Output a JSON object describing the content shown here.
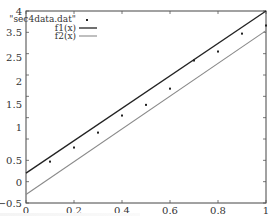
{
  "chart_data": {
    "type": "line",
    "title": "",
    "xlabel": "",
    "ylabel": "",
    "xlim": [
      0,
      1
    ],
    "ylim": [
      -0.5,
      4
    ],
    "grid": false,
    "legend_position": "top-left (inside)",
    "x_ticks": [
      "0",
      "0.2",
      "0.4",
      "0.6",
      "0.8",
      "1"
    ],
    "y_ticks_visible_labels": [
      "4",
      "3.5",
      "2.5",
      "2",
      "1.5",
      "1",
      "0.5",
      "0",
      "−0.5"
    ],
    "y_tick_values": [
      4,
      3.5,
      3,
      2.5,
      2,
      1.5,
      1,
      0.5,
      0,
      -0.5
    ],
    "series": [
      {
        "name": "\"sec4data.dat\"",
        "style": "points",
        "color": "#222222",
        "x": [
          0.1,
          0.2,
          0.3,
          0.4,
          0.5,
          0.6,
          0.7,
          0.8,
          0.9,
          1.0
        ],
        "y": [
          0.47,
          0.8,
          1.15,
          1.55,
          1.8,
          2.18,
          2.84,
          3.05,
          3.47,
          3.66
        ]
      },
      {
        "name": "f1(x)",
        "style": "line",
        "color": "#222222",
        "x": [
          0,
          1
        ],
        "y": [
          0.2,
          4.0
        ]
      },
      {
        "name": "f2(x)",
        "style": "line",
        "color": "#8a8a8a",
        "x": [
          0,
          1
        ],
        "y": [
          -0.3,
          3.54
        ]
      }
    ]
  },
  "legend": {
    "entries": [
      "\"sec4data.dat\"",
      "f1(x)",
      "f2(x)"
    ]
  },
  "axis_labels": {
    "x": [
      "0",
      "0.2",
      "0.4",
      "0.6",
      "0.8",
      "1"
    ],
    "y": [
      "4",
      "3.5",
      "2.5",
      "2",
      "1.5",
      "1",
      "0.5",
      "0",
      "−0.5"
    ]
  }
}
